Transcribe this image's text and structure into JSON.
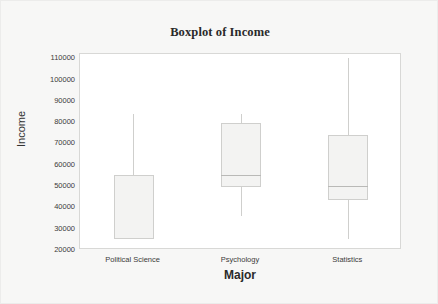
{
  "chart_data": {
    "type": "box",
    "title": "Boxplot of Income",
    "xlabel": "Major",
    "ylabel": "Income",
    "categories": [
      "Political Science",
      "Psychology",
      "Statistics"
    ],
    "ylim": [
      20000,
      112000
    ],
    "yticks": [
      110000,
      100000,
      90000,
      80000,
      70000,
      60000,
      50000,
      40000,
      30000,
      20000
    ],
    "ytick_labels": [
      "110000",
      "100000",
      "90000",
      "80000",
      "70000",
      "60000",
      "50000",
      "40000",
      "30000",
      "20000"
    ],
    "grid": false,
    "legend": "none",
    "boxes": [
      {
        "category": "Political Science",
        "whisker_high": 84000,
        "q3": 55000,
        "median": 55000,
        "q1": 25000,
        "whisker_low": 25000
      },
      {
        "category": "Psychology",
        "whisker_high": 84000,
        "q3": 79500,
        "median": 55000,
        "q1": 49500,
        "whisker_low": 36000
      },
      {
        "category": "Statistics",
        "whisker_high": 110000,
        "q3": 74000,
        "median": 50000,
        "q1": 43500,
        "whisker_low": 25000
      }
    ],
    "colors": {
      "box_fill": "#f3f3f2",
      "box_edge": "#cfcfcd",
      "median": "#b9b9b7",
      "plot_background": "#ffffff",
      "figure_background": "#f7f7f6",
      "text": "#2a2a2a"
    }
  }
}
